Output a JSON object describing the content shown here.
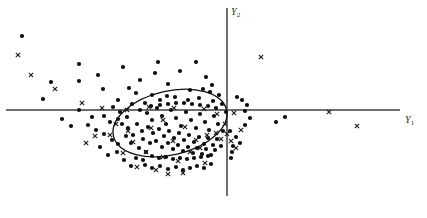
{
  "figure": {
    "width": 427,
    "height": 218,
    "background_color": "#ffffff"
  },
  "axes": {
    "horizontal": {
      "name": "Y1",
      "label_text": "Y",
      "label_sub": "1",
      "y_pixel": 110,
      "x_start": 6,
      "x_end": 400,
      "color": "#6f6f6f"
    },
    "vertical": {
      "name": "Y2",
      "label_text": "Y",
      "label_sub": "2",
      "x_pixel": 227,
      "y_start": 8,
      "y_end": 196,
      "color": "#6f6f6f"
    }
  },
  "chart_data": {
    "type": "scatter",
    "title": "",
    "xlabel": "Y1",
    "ylabel": "Y2",
    "origin_px": [
      227,
      110
    ],
    "xlim": [
      -221,
      173
    ],
    "ylim": [
      -86,
      102
    ],
    "grid": false,
    "legend": "none",
    "annotations": [
      {
        "kind": "ellipse",
        "label": "confidence-ellipse",
        "cx": 170,
        "cy": 123,
        "rx": 58,
        "ry": 32,
        "rotation_deg": -13,
        "stroke": "#111111"
      }
    ],
    "series": [
      {
        "name": "dots",
        "marker": "filled-circle",
        "color": "#0d0d0d",
        "radius_px": 2.1,
        "points_px": [
          [
            22,
            36
          ],
          [
            79,
            64
          ],
          [
            79,
            81
          ],
          [
            51,
            82
          ],
          [
            98,
            75
          ],
          [
            103,
            89
          ],
          [
            43,
            99
          ],
          [
            79,
            110
          ],
          [
            123,
            67
          ],
          [
            140,
            80
          ],
          [
            155,
            73
          ],
          [
            158,
            62
          ],
          [
            168,
            84
          ],
          [
            180,
            71
          ],
          [
            190,
            90
          ],
          [
            196,
            62
          ],
          [
            206,
            77
          ],
          [
            210,
            92
          ],
          [
            167,
            96
          ],
          [
            152,
            95
          ],
          [
            136,
            93
          ],
          [
            129,
            88
          ],
          [
            145,
            103
          ],
          [
            118,
            100
          ],
          [
            160,
            100
          ],
          [
            175,
            97
          ],
          [
            188,
            100
          ],
          [
            199,
            98
          ],
          [
            203,
            89
          ],
          [
            212,
            85
          ],
          [
            219,
            95
          ],
          [
            213,
            101
          ],
          [
            222,
            104
          ],
          [
            237,
            97
          ],
          [
            242,
            100
          ],
          [
            247,
            105
          ],
          [
            245,
            111
          ],
          [
            250,
            118
          ],
          [
            245,
            125
          ],
          [
            276,
            122
          ],
          [
            285,
            117
          ],
          [
            230,
            131
          ],
          [
            236,
            137
          ],
          [
            240,
            143
          ],
          [
            233,
            146
          ],
          [
            232,
            152
          ],
          [
            231,
            158
          ],
          [
            113,
            107
          ],
          [
            120,
            112
          ],
          [
            127,
            117
          ],
          [
            132,
            104
          ],
          [
            140,
            110
          ],
          [
            147,
            113
          ],
          [
            152,
            120
          ],
          [
            157,
            108
          ],
          [
            162,
            116
          ],
          [
            166,
            124
          ],
          [
            171,
            110
          ],
          [
            176,
            118
          ],
          [
            181,
            126
          ],
          [
            186,
            112
          ],
          [
            191,
            120
          ],
          [
            196,
            128
          ],
          [
            200,
            114
          ],
          [
            205,
            122
          ],
          [
            209,
            130
          ],
          [
            214,
            116
          ],
          [
            218,
            124
          ],
          [
            223,
            131
          ],
          [
            137,
            124
          ],
          [
            142,
            131
          ],
          [
            148,
            127
          ],
          [
            153,
            133
          ],
          [
            159,
            129
          ],
          [
            164,
            136
          ],
          [
            169,
            131
          ],
          [
            174,
            138
          ],
          [
            179,
            133
          ],
          [
            184,
            140
          ],
          [
            189,
            135
          ],
          [
            194,
            142
          ],
          [
            199,
            137
          ],
          [
            204,
            144
          ],
          [
            208,
            138
          ],
          [
            213,
            145
          ],
          [
            217,
            139
          ],
          [
            221,
            146
          ],
          [
            143,
            139
          ],
          [
            150,
            143
          ],
          [
            156,
            141
          ],
          [
            162,
            147
          ],
          [
            168,
            143
          ],
          [
            173,
            149
          ],
          [
            178,
            145
          ],
          [
            183,
            151
          ],
          [
            188,
            147
          ],
          [
            193,
            153
          ],
          [
            197,
            148
          ],
          [
            202,
            154
          ],
          [
            206,
            149
          ],
          [
            211,
            155
          ],
          [
            215,
            150
          ],
          [
            133,
            135
          ],
          [
            128,
            128
          ],
          [
            122,
            124
          ],
          [
            118,
            119
          ],
          [
            126,
            136
          ],
          [
            131,
            143
          ],
          [
            139,
            148
          ],
          [
            146,
            152
          ],
          [
            152,
            156
          ],
          [
            159,
            158
          ],
          [
            166,
            157
          ],
          [
            173,
            159
          ],
          [
            180,
            158
          ],
          [
            187,
            159
          ],
          [
            194,
            158
          ],
          [
            201,
            157
          ],
          [
            208,
            156
          ],
          [
            96,
            130
          ],
          [
            104,
            134
          ],
          [
            112,
            140
          ],
          [
            100,
            147
          ],
          [
            108,
            155
          ],
          [
            117,
            152
          ],
          [
            124,
            160
          ],
          [
            131,
            166
          ],
          [
            145,
            165
          ],
          [
            152,
            168
          ],
          [
            160,
            166
          ],
          [
            168,
            169
          ],
          [
            176,
            167
          ],
          [
            183,
            170
          ],
          [
            190,
            168
          ],
          [
            197,
            166
          ],
          [
            204,
            168
          ],
          [
            211,
            164
          ],
          [
            62,
            119
          ],
          [
            71,
            126
          ],
          [
            88,
            125
          ],
          [
            92,
            117
          ],
          [
            136,
            158
          ],
          [
            143,
            160
          ],
          [
            118,
            144
          ],
          [
            110,
            122
          ],
          [
            104,
            116
          ],
          [
            216,
            108
          ],
          [
            208,
            106
          ],
          [
            200,
            105
          ],
          [
            192,
            104
          ],
          [
            184,
            103
          ],
          [
            176,
            103
          ],
          [
            168,
            104
          ],
          [
            160,
            105
          ],
          [
            151,
            106
          ],
          [
            226,
            112
          ]
        ]
      },
      {
        "name": "crosses",
        "marker": "x",
        "color": "#1a1a1a",
        "size_px": 4.4,
        "points_px": [
          [
            18,
            55
          ],
          [
            31,
            75
          ],
          [
            55,
            89
          ],
          [
            82,
            103
          ],
          [
            102,
            108
          ],
          [
            127,
            110
          ],
          [
            149,
            107
          ],
          [
            174,
            108
          ],
          [
            204,
            109
          ],
          [
            217,
            114
          ],
          [
            234,
            113
          ],
          [
            261,
            57
          ],
          [
            329,
            112
          ],
          [
            357,
            126
          ],
          [
            116,
            124
          ],
          [
            128,
            131
          ],
          [
            151,
            128
          ],
          [
            163,
            120
          ],
          [
            185,
            127
          ],
          [
            196,
            140
          ],
          [
            207,
            135
          ],
          [
            216,
            133
          ],
          [
            221,
            139
          ],
          [
            146,
            152
          ],
          [
            163,
            157
          ],
          [
            178,
            161
          ],
          [
            190,
            152
          ],
          [
            205,
            163
          ],
          [
            200,
            148
          ],
          [
            173,
            141
          ],
          [
            133,
            142
          ],
          [
            110,
            135
          ],
          [
            95,
            136
          ],
          [
            86,
            143
          ],
          [
            123,
            153
          ],
          [
            137,
            167
          ],
          [
            156,
            170
          ],
          [
            168,
            174
          ],
          [
            183,
            173
          ],
          [
            227,
            134
          ],
          [
            231,
            141
          ],
          [
            236,
            148
          ],
          [
            241,
            130
          ],
          [
            225,
            124
          ]
        ]
      }
    ]
  }
}
